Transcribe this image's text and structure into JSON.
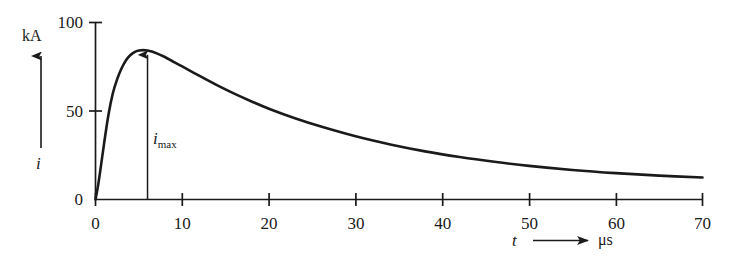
{
  "chart_data": {
    "type": "line",
    "title": "",
    "subtitle": "",
    "xlabel": "t",
    "xunit": "μs",
    "ylabel": "i",
    "yunit": "kA",
    "xlim": [
      0,
      70
    ],
    "ylim": [
      0,
      100
    ],
    "grid": false,
    "legend": null,
    "x_ticks": [
      0,
      10,
      20,
      30,
      40,
      50,
      60,
      70
    ],
    "x_tick_labels": [
      "0",
      "10",
      "20",
      "30",
      "40",
      "50",
      "60",
      "70"
    ],
    "y_ticks": [
      0,
      50,
      100
    ],
    "y_tick_labels": [
      "0",
      "50",
      "100"
    ],
    "annotations": [
      {
        "name": "i-max-arrow",
        "label_base": "i",
        "label_sub": "max",
        "x": 6,
        "y": 84,
        "description": "vertical arrow from baseline to curve peak"
      }
    ],
    "series": [
      {
        "name": "lightning impulse current",
        "x": [
          0,
          0.3,
          0.6,
          1,
          1.5,
          2,
          2.5,
          3,
          3.5,
          4,
          4.5,
          5,
          5.5,
          6,
          6.5,
          7,
          8,
          9,
          10,
          12,
          14,
          16,
          18,
          20,
          23,
          26,
          30,
          34,
          38,
          42,
          46,
          50,
          55,
          60,
          65,
          70
        ],
        "y": [
          0,
          8,
          18,
          32,
          48,
          60,
          68,
          74,
          78.5,
          81.5,
          83.3,
          84.2,
          84.4,
          84.2,
          83.6,
          82.7,
          80.5,
          77.8,
          75.2,
          69.8,
          64.6,
          59.8,
          55.4,
          51.3,
          45.9,
          41.2,
          35.7,
          31.1,
          27.2,
          24.0,
          21.3,
          19.0,
          16.7,
          14.9,
          13.5,
          12.4
        ]
      }
    ],
    "peak": {
      "x": 6,
      "y": 84.4
    }
  },
  "axis_labels": {
    "y_quantity": "i",
    "y_unit": "kA",
    "x_quantity": "t",
    "x_unit": "μs",
    "x_origin_label": "0",
    "y_origin_label": "0"
  }
}
